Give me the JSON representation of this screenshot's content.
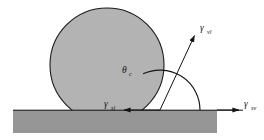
{
  "figure": {
    "background_color": "#ffffff",
    "droplet": {
      "name": "liquid droplet",
      "fill_color": "#b3b3b3",
      "stroke_color": "#1a1a1a",
      "center_x": 107,
      "center_y": 65,
      "radius": 57
    },
    "substrate": {
      "name": "solid substrate",
      "fill_color": "#969696",
      "x": 13,
      "y": 110,
      "width": 204,
      "height": 23
    },
    "baseline": {
      "name": "solid-vapor interface line",
      "y": 110,
      "x_start": 13,
      "x_end": 247,
      "color": "#141414"
    },
    "contact_point": {
      "x": 160,
      "y": 110
    },
    "angle_arc": {
      "name": "contact angle arc",
      "radius": 40,
      "start_deg": 0,
      "end_deg": 115,
      "color": "#141414"
    },
    "vectors": [
      {
        "id": "gamma-lv",
        "symbol": "γ",
        "subscript": "vl",
        "label_full": "γvl",
        "direction": "up-right",
        "angle_deg": 64,
        "from_x": 160,
        "from_y": 110,
        "to_x": 197,
        "to_y": 33,
        "label_x": 201,
        "label_y": 30
      },
      {
        "id": "gamma-sl",
        "symbol": "γ",
        "subscript": "sl",
        "label_full": "γsl",
        "direction": "left",
        "angle_deg": 180,
        "from_x": 160,
        "from_y": 110,
        "to_x": 120,
        "to_y": 110,
        "label_x": 104,
        "label_y": 107
      },
      {
        "id": "gamma-sv",
        "symbol": "γ",
        "subscript": "sv",
        "label_full": "γsv",
        "direction": "right",
        "angle_deg": 0,
        "from_x": 217,
        "from_y": 110,
        "to_x": 243,
        "to_y": 110,
        "label_x": 246,
        "label_y": 107
      }
    ],
    "angle_label": {
      "id": "theta-c",
      "symbol": "θ",
      "subscript": "c",
      "label_full": "θc",
      "x": 124,
      "y": 73
    }
  }
}
